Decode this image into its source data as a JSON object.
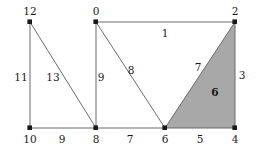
{
  "figure": {
    "width": 256,
    "height": 161,
    "background": "#ffffff",
    "stroke_color": "#6b6b6b",
    "vertex_color": "#1a1a1a",
    "shaded_face_color": "#a8a8a8",
    "label_color": "#1a1a1a"
  },
  "diagram": {
    "type": "planar-graph",
    "vertices": [
      {
        "id": "v12",
        "label": "12",
        "x": 30,
        "y": 22,
        "label_x": 30,
        "label_y": 11
      },
      {
        "id": "v0",
        "label": "0",
        "x": 96,
        "y": 22,
        "label_x": 96,
        "label_y": 11
      },
      {
        "id": "v2",
        "label": "2",
        "x": 235,
        "y": 22,
        "label_x": 235,
        "label_y": 11
      },
      {
        "id": "v10",
        "label": "10",
        "x": 30,
        "y": 128,
        "label_x": 30,
        "label_y": 139
      },
      {
        "id": "v8",
        "label": "8",
        "x": 96,
        "y": 128,
        "label_x": 96,
        "label_y": 139
      },
      {
        "id": "v6",
        "label": "6",
        "x": 165,
        "y": 128,
        "label_x": 165,
        "label_y": 139
      },
      {
        "id": "v4",
        "label": "4",
        "x": 235,
        "y": 128,
        "label_x": 235,
        "label_y": 139
      }
    ],
    "edges": [
      {
        "id": "e-12-10",
        "from": "v12",
        "to": "v10",
        "label": "11",
        "label_x": 21,
        "label_y": 77
      },
      {
        "id": "e-12-8",
        "from": "v12",
        "to": "v8",
        "label": "13",
        "label_x": 53,
        "label_y": 77
      },
      {
        "id": "e-10-8",
        "from": "v10",
        "to": "v8",
        "label": "9",
        "label_x": 62,
        "label_y": 139
      },
      {
        "id": "e-0-8",
        "from": "v0",
        "to": "v8",
        "label": "9",
        "label_x": 101,
        "label_y": 77
      },
      {
        "id": "e-0-6",
        "from": "v0",
        "to": "v6",
        "label": "8",
        "label_x": 131,
        "label_y": 70
      },
      {
        "id": "e-0-2",
        "from": "v0",
        "to": "v2",
        "label": "1",
        "label_x": 165,
        "label_y": 33
      },
      {
        "id": "e-8-6",
        "from": "v8",
        "to": "v6",
        "label": "7",
        "label_x": 130,
        "label_y": 139
      },
      {
        "id": "e-6-2",
        "from": "v6",
        "to": "v2",
        "label": "7",
        "label_x": 198,
        "label_y": 67
      },
      {
        "id": "e-2-4",
        "from": "v2",
        "to": "v4",
        "label": "3",
        "label_x": 242,
        "label_y": 75
      },
      {
        "id": "e-6-4",
        "from": "v6",
        "to": "v4",
        "label": "5",
        "label_x": 200,
        "label_y": 139
      }
    ],
    "faces": [
      {
        "id": "face-shaded",
        "label": "6",
        "shaded": true,
        "fill": "#a8a8a8",
        "polygon": "165,128 235,22 235,128",
        "label_x": 215,
        "label_y": 92
      }
    ]
  }
}
